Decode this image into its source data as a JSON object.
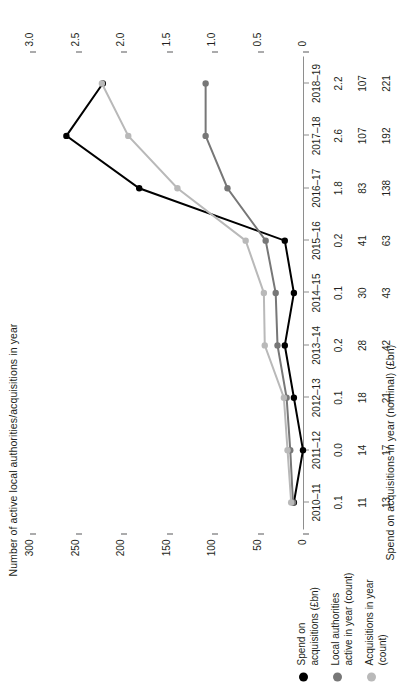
{
  "chart_data": {
    "type": "line",
    "title": "",
    "categories": [
      "2010–11",
      "2011–12",
      "2012–13",
      "2013–14",
      "2014–15",
      "2015–16",
      "2016–17",
      "2017–18",
      "2018–19"
    ],
    "series": [
      {
        "name": "Spend on acquisitions (£bn)",
        "axis": "left",
        "color": "#000000",
        "values": [
          0.1,
          0.0,
          0.1,
          0.2,
          0.1,
          0.2,
          1.8,
          2.6,
          2.2
        ]
      },
      {
        "name": "Local authorities active in year (count)",
        "axis": "right",
        "color": "#777777",
        "values": [
          11,
          14,
          18,
          28,
          30,
          41,
          83,
          107,
          107
        ]
      },
      {
        "name": "Acquisitions in year (count)",
        "axis": "right",
        "color": "#b9b9b9",
        "values": [
          13,
          17,
          21,
          42,
          43,
          63,
          138,
          192,
          221
        ]
      }
    ],
    "left_axis": {
      "label": "Spend on acquisitions in year (nominal) (£bn)",
      "ticks": [
        "0",
        "0.5",
        "1.0",
        "1.5",
        "2.0",
        "2.5",
        "3.0"
      ],
      "min": 0,
      "max": 3.0
    },
    "right_axis": {
      "label": "Number of active local authorities/acquisitions in year",
      "ticks": [
        "0",
        "50",
        "100",
        "150",
        "200",
        "250",
        "300"
      ],
      "min": 0,
      "max": 300
    },
    "xlabel": "",
    "grid": false,
    "legend_position": "bottom-left",
    "table": {
      "rows": [
        {
          "key": "spend",
          "values": [
            "0.1",
            "0.0",
            "0.1",
            "0.2",
            "0.1",
            "0.2",
            "1.8",
            "2.6",
            "2.2"
          ]
        },
        {
          "key": "authorities",
          "values": [
            "11",
            "14",
            "18",
            "28",
            "30",
            "41",
            "83",
            "107",
            "107"
          ]
        },
        {
          "key": "acquisitions",
          "values": [
            "13",
            "17",
            "21",
            "42",
            "43",
            "63",
            "138",
            "192",
            "221"
          ]
        }
      ]
    }
  },
  "legend": {
    "items": [
      {
        "line1": "Spend on",
        "line2": "acquisitions (£bn)",
        "color": "#000000"
      },
      {
        "line1": "Local authorities",
        "line2": "active in year (count)",
        "color": "#777777"
      },
      {
        "line1": "Acquisitions in year",
        "line2": "(count)",
        "color": "#b9b9b9"
      }
    ]
  }
}
